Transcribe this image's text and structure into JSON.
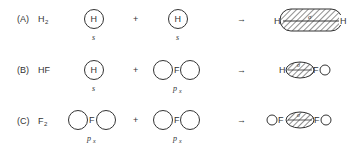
{
  "rows": [
    {
      "label": "(A)",
      "molecule": "H",
      "sub": "2",
      "left_atom": "H",
      "left_orbital": "s",
      "right_atom": "H",
      "right_orbital": "s",
      "plus": "+",
      "arrow": "→",
      "product_left": "H",
      "product_right": "H",
      "bond": "σ"
    },
    {
      "label": "(B)",
      "molecule": "HF",
      "sub": "",
      "left_atom": "H",
      "left_orbital": "s",
      "right_atom": "F",
      "right_orbital": "p",
      "right_orbital_sub": "x",
      "plus": "+",
      "arrow": "→",
      "product_left": "H",
      "product_right": "F",
      "bond": "σ"
    },
    {
      "label": "(C)",
      "molecule": "F",
      "sub": "2",
      "left_atom": "F",
      "left_orbital": "p",
      "left_orbital_sub": "x",
      "right_atom": "F",
      "right_orbital": "p",
      "right_orbital_sub": "x",
      "plus": "+",
      "arrow": "→",
      "product_left": "F",
      "product_right": "F",
      "bond": "σ"
    }
  ]
}
